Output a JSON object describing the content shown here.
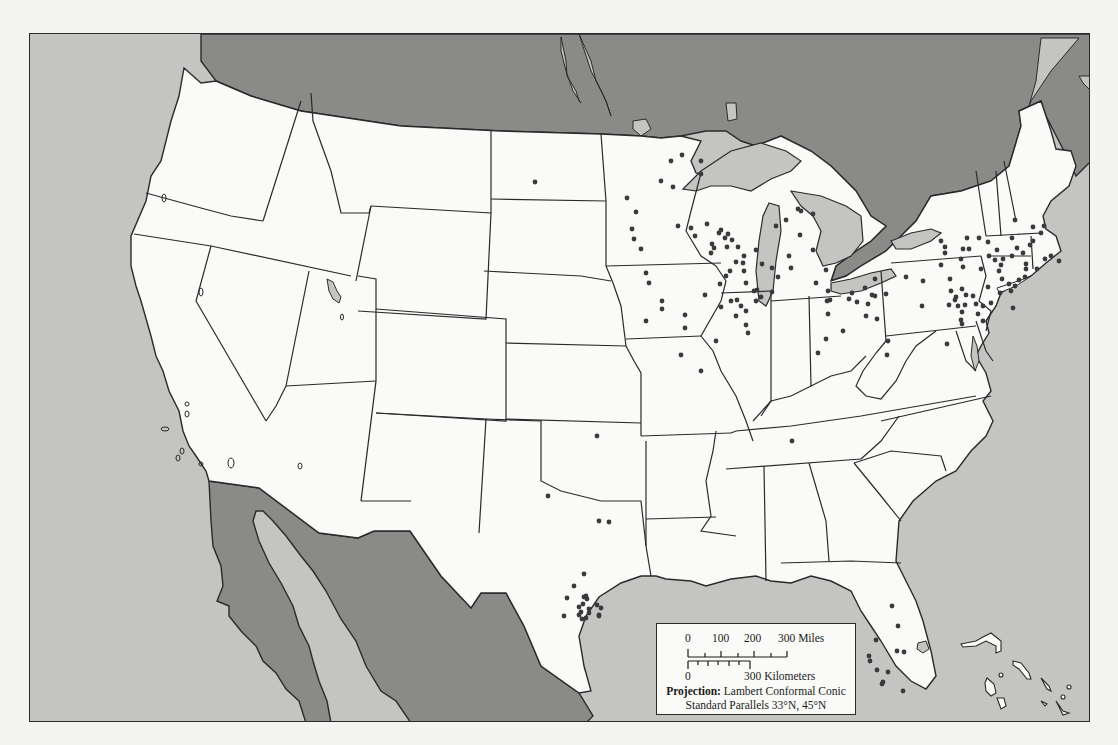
{
  "map": {
    "type": "dot-distribution",
    "region": "Contiguous United States",
    "colors": {
      "land_us": "#fafaf8",
      "land_foreign": "#8a8a88",
      "water": "#c4c4c2",
      "border": "#2a2a2a",
      "dot": "#3a3a3a"
    },
    "legend": {
      "scale_miles_ticks": [
        "0",
        "100",
        "200",
        "300 Miles"
      ],
      "scale_km_ticks": [
        "0",
        "300 Kilometers"
      ],
      "projection_label": "Projection:",
      "projection_value": "Lambert Conformal Conic",
      "standard_parallels": "Standard Parallels 33°N, 45°N"
    },
    "dots": [
      [
        534,
        181
      ],
      [
        626,
        197
      ],
      [
        660,
        180
      ],
      [
        672,
        186
      ],
      [
        670,
        160
      ],
      [
        681,
        154
      ],
      [
        635,
        211
      ],
      [
        633,
        238
      ],
      [
        631,
        228
      ],
      [
        640,
        248
      ],
      [
        645,
        272
      ],
      [
        648,
        282
      ],
      [
        661,
        300
      ],
      [
        645,
        320
      ],
      [
        661,
        308
      ],
      [
        700,
        160
      ],
      [
        700,
        173
      ],
      [
        677,
        225
      ],
      [
        690,
        227
      ],
      [
        711,
        243
      ],
      [
        710,
        252
      ],
      [
        713,
        247
      ],
      [
        694,
        235
      ],
      [
        706,
        223
      ],
      [
        718,
        232
      ],
      [
        720,
        229
      ],
      [
        724,
        237
      ],
      [
        727,
        233
      ],
      [
        731,
        239
      ],
      [
        726,
        246
      ],
      [
        737,
        246
      ],
      [
        743,
        255
      ],
      [
        735,
        261
      ],
      [
        729,
        270
      ],
      [
        743,
        270
      ],
      [
        742,
        262
      ],
      [
        725,
        275
      ],
      [
        719,
        283
      ],
      [
        704,
        294
      ],
      [
        730,
        300
      ],
      [
        736,
        299
      ],
      [
        740,
        305
      ],
      [
        720,
        306
      ],
      [
        745,
        310
      ],
      [
        735,
        315
      ],
      [
        745,
        282
      ],
      [
        756,
        289
      ],
      [
        760,
        296
      ],
      [
        755,
        249
      ],
      [
        684,
        314
      ],
      [
        684,
        327
      ],
      [
        700,
        370
      ],
      [
        680,
        354
      ],
      [
        715,
        340
      ],
      [
        745,
        324
      ],
      [
        747,
        332
      ],
      [
        753,
        290
      ],
      [
        755,
        300
      ],
      [
        771,
        291
      ],
      [
        761,
        263
      ],
      [
        771,
        267
      ],
      [
        775,
        225
      ],
      [
        785,
        219
      ],
      [
        797,
        208
      ],
      [
        800,
        210
      ],
      [
        812,
        213
      ],
      [
        799,
        234
      ],
      [
        812,
        249
      ],
      [
        788,
        255
      ],
      [
        790,
        267
      ],
      [
        777,
        276
      ],
      [
        815,
        282
      ],
      [
        827,
        290
      ],
      [
        825,
        269
      ],
      [
        826,
        300
      ],
      [
        827,
        313
      ],
      [
        825,
        338
      ],
      [
        829,
        299
      ],
      [
        848,
        298
      ],
      [
        851,
        292
      ],
      [
        856,
        301
      ],
      [
        864,
        287
      ],
      [
        871,
        294
      ],
      [
        874,
        295
      ],
      [
        874,
        278
      ],
      [
        867,
        303
      ],
      [
        865,
        315
      ],
      [
        876,
        318
      ],
      [
        842,
        330
      ],
      [
        817,
        352
      ],
      [
        886,
        354
      ],
      [
        887,
        340
      ],
      [
        885,
        293
      ],
      [
        905,
        276
      ],
      [
        922,
        280
      ],
      [
        921,
        305
      ],
      [
        944,
        252
      ],
      [
        960,
        258
      ],
      [
        962,
        248
      ],
      [
        955,
        296
      ],
      [
        957,
        305
      ],
      [
        961,
        311
      ],
      [
        960,
        319
      ],
      [
        961,
        323
      ],
      [
        949,
        278
      ],
      [
        950,
        290
      ],
      [
        954,
        299
      ],
      [
        961,
        288
      ],
      [
        948,
        304
      ],
      [
        964,
        304
      ],
      [
        972,
        295
      ],
      [
        982,
        305
      ],
      [
        990,
        302
      ],
      [
        987,
        286
      ],
      [
        982,
        320
      ],
      [
        977,
        313
      ],
      [
        965,
        294
      ],
      [
        975,
        303
      ],
      [
        946,
        343
      ],
      [
        940,
        240
      ],
      [
        944,
        246
      ],
      [
        940,
        264
      ],
      [
        962,
        266
      ],
      [
        968,
        248
      ],
      [
        966,
        237
      ],
      [
        978,
        237
      ],
      [
        987,
        241
      ],
      [
        988,
        255
      ],
      [
        980,
        268
      ],
      [
        996,
        249
      ],
      [
        994,
        259
      ],
      [
        1014,
        219
      ],
      [
        1011,
        237
      ],
      [
        1016,
        247
      ],
      [
        1029,
        244
      ],
      [
        1022,
        252
      ],
      [
        998,
        270
      ],
      [
        1001,
        278
      ],
      [
        1008,
        283
      ],
      [
        1014,
        285
      ],
      [
        1010,
        290
      ],
      [
        1018,
        279
      ],
      [
        1024,
        276
      ],
      [
        1025,
        268
      ],
      [
        1036,
        268
      ],
      [
        1044,
        258
      ],
      [
        1032,
        240
      ],
      [
        1040,
        232
      ],
      [
        1043,
        225
      ],
      [
        1032,
        226
      ],
      [
        1011,
        255
      ],
      [
        1002,
        258
      ],
      [
        1000,
        264
      ],
      [
        1025,
        263
      ],
      [
        1050,
        255
      ],
      [
        1058,
        260
      ],
      [
        999,
        292
      ],
      [
        1012,
        307
      ],
      [
        596,
        435
      ],
      [
        547,
        495
      ],
      [
        598,
        520
      ],
      [
        608,
        521
      ],
      [
        583,
        573
      ],
      [
        573,
        585
      ],
      [
        566,
        597
      ],
      [
        586,
        598
      ],
      [
        583,
        596
      ],
      [
        585,
        595
      ],
      [
        582,
        603
      ],
      [
        588,
        608
      ],
      [
        580,
        611
      ],
      [
        596,
        604
      ],
      [
        578,
        614
      ],
      [
        581,
        618
      ],
      [
        588,
        612
      ],
      [
        598,
        615
      ],
      [
        600,
        607
      ],
      [
        563,
        615
      ],
      [
        585,
        617
      ],
      [
        578,
        606
      ],
      [
        598,
        614
      ],
      [
        791,
        440
      ],
      [
        891,
        605
      ],
      [
        897,
        625
      ],
      [
        875,
        639
      ],
      [
        896,
        650
      ],
      [
        903,
        651
      ],
      [
        876,
        669
      ],
      [
        882,
        681
      ],
      [
        881,
        683
      ],
      [
        902,
        690
      ],
      [
        887,
        671
      ],
      [
        869,
        660
      ],
      [
        868,
        655
      ]
    ]
  }
}
